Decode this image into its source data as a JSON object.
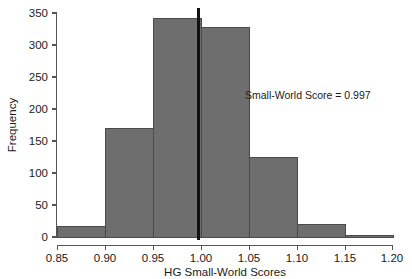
{
  "chart_data": {
    "type": "bar",
    "title": "",
    "subtitle": "",
    "xlabel": "HG Small-World Scores",
    "ylabel": "Frequency",
    "xlim": [
      0.85,
      1.2
    ],
    "ylim": [
      0,
      350
    ],
    "grid": false,
    "legend": null,
    "bin_width": 0.05,
    "bin_edges": [
      0.85,
      0.9,
      0.95,
      1.0,
      1.05,
      1.1,
      1.15,
      1.2
    ],
    "categories": [
      "0.85-0.90",
      "0.90-0.95",
      "0.95-1.00",
      "1.00-1.05",
      "1.05-1.10",
      "1.10-1.15",
      "1.15-1.20"
    ],
    "values": [
      17,
      170,
      342,
      328,
      125,
      19,
      2
    ],
    "xticks": [
      "0.85",
      "0.90",
      "0.95",
      "1.00",
      "1.05",
      "1.10",
      "1.15",
      "1.20"
    ],
    "xtick_values": [
      0.85,
      0.9,
      0.95,
      1.0,
      1.05,
      1.1,
      1.15,
      1.2
    ],
    "yticks": [
      "0",
      "50",
      "100",
      "150",
      "200",
      "250",
      "300",
      "350"
    ],
    "ytick_values": [
      0,
      50,
      100,
      150,
      200,
      250,
      300,
      350
    ],
    "bar_fill_color": "#6e6e6e",
    "bar_edge_color": "#4a4a4a",
    "annotations": [
      {
        "name": "small-world-score-label",
        "text": "Small-World Score = 0.997",
        "x": 1.065,
        "y": 235
      },
      {
        "name": "small-world-score-reference-line",
        "type": "vline",
        "x": 0.997,
        "color": "#111111"
      }
    ]
  },
  "axes": {
    "y_title": "Frequency",
    "x_title": "HG Small-World Scores"
  }
}
